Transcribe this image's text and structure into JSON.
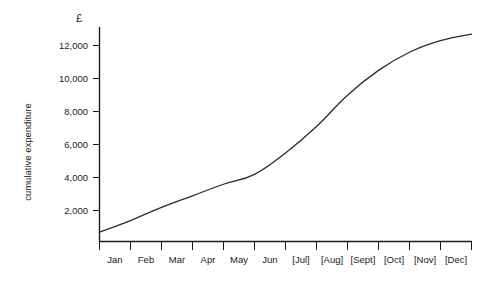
{
  "chart_data": {
    "type": "line",
    "title": "",
    "subtitle": "",
    "xlabel": "",
    "ylabel": "cumulative expenditure",
    "currency_symbol": "£",
    "categories": [
      "Jan",
      "Feb",
      "Mar",
      "Apr",
      "May",
      "Jun",
      "[Jul]",
      "[Aug]",
      "[Sept]",
      "[Oct]",
      "[Nov]",
      "[Dec]"
    ],
    "values": [
      1300,
      2100,
      2800,
      3500,
      4100,
      5400,
      7000,
      8900,
      10400,
      11500,
      12200,
      12600
    ],
    "start_value": 600,
    "series": [
      {
        "name": "cumulative expenditure",
        "values": [
          1300,
          2100,
          2800,
          3500,
          4100,
          5400,
          7000,
          8900,
          10400,
          11500,
          12200,
          12600
        ]
      }
    ],
    "ytick_labels": [
      "12,000",
      "10,000",
      "8,000",
      "6,000",
      "4,000",
      "2,000"
    ],
    "ytick_values": [
      12000,
      10000,
      8000,
      6000,
      4000,
      2000
    ],
    "ylim": [
      0,
      13000
    ],
    "xlim": [
      0,
      12
    ],
    "grid": false,
    "legend": false,
    "legend_position": "none"
  }
}
